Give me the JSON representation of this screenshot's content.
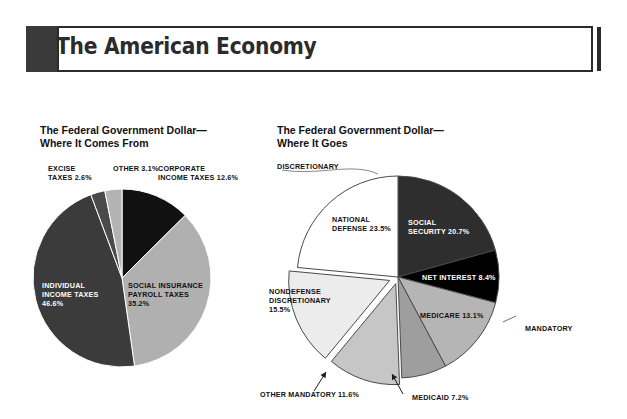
{
  "banner": {
    "title": "The American Economy"
  },
  "sections": {
    "left": {
      "heading": "The Federal Government Dollar—\nWhere It Comes From"
    },
    "right": {
      "heading": "The Federal Government Dollar—\nWhere It Goes"
    }
  },
  "annotations": {
    "discretionary": "DISCRETIONARY",
    "mandatory": "MANDATORY"
  },
  "chart_data": [
    {
      "type": "pie",
      "title": "The Federal Government Dollar—Where It Comes From",
      "labels": [
        "INDIVIDUAL INCOME TAXES",
        "EXCISE TAXES",
        "OTHER",
        "CORPORATE INCOME TAXES",
        "SOCIAL INSURANCE PAYROLL TAXES"
      ],
      "values": [
        46.6,
        2.6,
        3.1,
        12.6,
        35.2
      ],
      "value_labels": [
        "46.6%",
        "2.6%",
        "3.1%",
        "12.6%",
        "35.2%"
      ],
      "colors": [
        "#3b3b3b",
        "#4a4a4a",
        "#b3b3b3",
        "#111111",
        "#b0b0b0"
      ],
      "legend": "none",
      "slice_text": [
        "INDIVIDUAL\nINCOME TAXES\n46.6%",
        "EXCISE\nTAXES 2.6%",
        "OTHER 3.1%",
        "CORPORATE\nINCOME TAXES 12.6%",
        "SOCIAL INSURANCE\nPAYROLL TAXES\n35.2%"
      ]
    },
    {
      "type": "pie",
      "title": "The Federal Government Dollar—Where It Goes",
      "labels": [
        "SOCIAL SECURITY",
        "NET INTEREST",
        "MEDICARE",
        "MEDICAID",
        "OTHER MANDATORY",
        "NONDEFENSE DISCRETIONARY",
        "NATIONAL DEFENSE"
      ],
      "values": [
        20.7,
        8.4,
        13.1,
        7.2,
        11.6,
        15.5,
        23.5
      ],
      "value_labels": [
        "20.7%",
        "8.4%",
        "13.1%",
        "7.2%",
        "11.6%",
        "15.5%",
        "23.5%"
      ],
      "colors": [
        "#2e2e2e",
        "#000000",
        "#b5b5b5",
        "#9e9e9e",
        "#c6c6c6",
        "#ececec",
        "#ffffff"
      ],
      "groups": {
        "MANDATORY": [
          "SOCIAL SECURITY",
          "NET INTEREST",
          "MEDICARE",
          "MEDICAID",
          "OTHER MANDATORY"
        ],
        "DISCRETIONARY": [
          "NONDEFENSE DISCRETIONARY",
          "NATIONAL DEFENSE"
        ]
      },
      "legend": "none",
      "slice_text": [
        "SOCIAL\nSECURITY 20.7%",
        "NET INTEREST 8.4%",
        "MEDICARE 13.1%",
        "MEDICAID 7.2%",
        "OTHER MANDATORY 11.6%",
        "NONDEFENSE\nDISCRETIONARY\n15.5%",
        "NATIONAL\nDEFENSE 23.5%"
      ]
    }
  ]
}
